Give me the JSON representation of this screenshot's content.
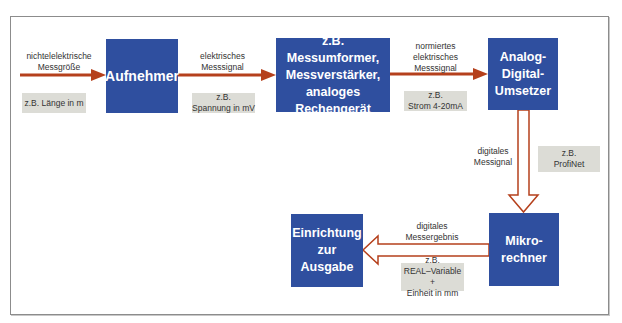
{
  "colors": {
    "block_fill": "#2f4f9f",
    "note_fill": "#dcdcd6",
    "arrow": "#b5401c",
    "frame": "#8c8c8c"
  },
  "blocks": [
    {
      "id": "aufnehmer",
      "text": "Aufnehmer"
    },
    {
      "id": "messumformer",
      "text": "z.B. Messumformer,\nMessverstärker,\nanaloges\nRechengerät"
    },
    {
      "id": "adc",
      "text": "Analog-\nDigital-\nUmsetzer"
    },
    {
      "id": "mikrorechner",
      "text": "Mikro-\nrechner"
    },
    {
      "id": "ausgabe",
      "text": "Einrichtung\nzur\nAusgabe"
    }
  ],
  "signal_labels": [
    {
      "id": "input",
      "text": "nichtelelektrische\nMessgröße"
    },
    {
      "id": "electrical",
      "text": "elektrisches\nMesssignal"
    },
    {
      "id": "normalized",
      "text": "normiertes\nelektrisches\nMesssignal"
    },
    {
      "id": "digital",
      "text": "digitales\nMessignal"
    },
    {
      "id": "result",
      "text": "digitales\nMessergebnis"
    }
  ],
  "examples": [
    {
      "id": "laenge",
      "text": "z.B. Länge in m"
    },
    {
      "id": "spannung",
      "text": "z.B.\nSpannung in mV"
    },
    {
      "id": "strom",
      "text": "z.B.\nStrom 4-20mA"
    },
    {
      "id": "profinet",
      "text": "z.B.\nProfiNet"
    },
    {
      "id": "real",
      "text": "z.B.\nREAL–Variable +\nEinheit in mm"
    }
  ]
}
